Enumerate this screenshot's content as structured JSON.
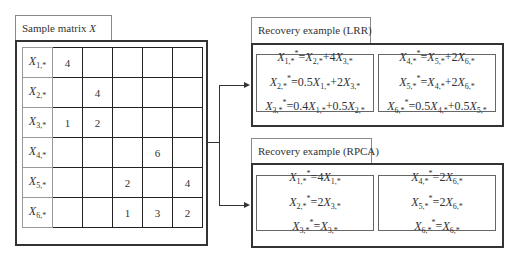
{
  "sample_matrix": {
    "title": "Sample matrix",
    "title_var": "X",
    "rows": [
      {
        "label": "X",
        "sub": "1,*",
        "cells": [
          "4",
          "",
          "",
          "",
          ""
        ]
      },
      {
        "label": "X",
        "sub": "2,*",
        "cells": [
          "",
          "4",
          "",
          "",
          ""
        ]
      },
      {
        "label": "X",
        "sub": "3,*",
        "cells": [
          "1",
          "2",
          "",
          "",
          ""
        ]
      },
      {
        "label": "X",
        "sub": "4,*",
        "cells": [
          "",
          "",
          "",
          "6",
          ""
        ]
      },
      {
        "label": "X",
        "sub": "5,*",
        "cells": [
          "",
          "",
          "2",
          "",
          "4"
        ]
      },
      {
        "label": "X",
        "sub": "6,*",
        "cells": [
          "",
          "",
          "1",
          "3",
          "2"
        ]
      }
    ]
  },
  "lrr": {
    "title": "Recovery example (LRR)",
    "left_equations": [
      "X1,*^* = X2,* + 4X3,*",
      "X2,*^* = 0.5X1,* + 2X3,*",
      "X3,*^* = 0.4X1,* + 0.5X2,*"
    ],
    "right_equations": [
      "X4,*^* = X5,* + 2X6,*",
      "X5,*^* = X4,* + 2X6,*",
      "X6,*^* = 0.5X4,* + 0.5X5,*"
    ]
  },
  "rpca": {
    "title": "Recovery example (RPCA)",
    "left_equations": [
      "X1,*^* = 4X1,*",
      "X2,*^* = 2X3,*",
      "X3,*^* = X3,*"
    ],
    "right_equations": [
      "X4,*^* = 2X6,*",
      "X5,*^* = 2X6,*",
      "X6,*^* = X6,*"
    ]
  },
  "colors": {
    "border_dark": "#333333",
    "border_light": "#8a8a8a",
    "background": "#ffffff"
  }
}
